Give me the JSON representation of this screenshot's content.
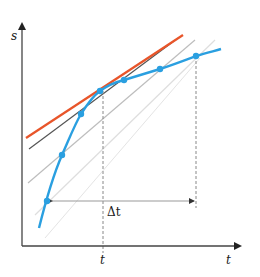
{
  "axes": {
    "y_label": "s",
    "x_label": "t"
  },
  "annotations": {
    "t_mark": "t",
    "delta_label": "Δt"
  },
  "colors": {
    "curve": "#2a9fe0",
    "tangent": "#e8552a",
    "near_secant": "#555555",
    "secant_mid": "#b9b9b9",
    "secant_far": "#dcdcdc",
    "axis": "#444444",
    "dashed": "#888888"
  },
  "curve_points": [
    {
      "x": 47,
      "y": 201
    },
    {
      "x": 62,
      "y": 155
    },
    {
      "x": 81,
      "y": 114
    },
    {
      "x": 100,
      "y": 91
    },
    {
      "x": 124,
      "y": 80
    },
    {
      "x": 160,
      "y": 69
    },
    {
      "x": 196,
      "y": 56
    }
  ]
}
